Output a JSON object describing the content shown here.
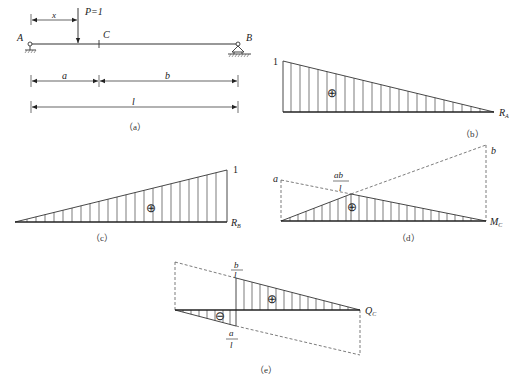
{
  "figure": {
    "panel_a": {
      "caption": "（a）",
      "support_left": "A",
      "support_right": "B",
      "section": "C",
      "load": "P=1",
      "dim_x": "x",
      "dim_a": "a",
      "dim_b": "b",
      "dim_l": "l"
    },
    "panel_b": {
      "caption": "（b）",
      "max_value": "1",
      "sign": "⊕",
      "name": "R",
      "sub": "A"
    },
    "panel_c": {
      "caption": "（c）",
      "max_value": "1",
      "sign": "⊕",
      "name": "R",
      "sub": "B"
    },
    "panel_d": {
      "caption": "（d）",
      "left_ordinate": "a",
      "right_ordinate": "b",
      "peak_num": "ab",
      "peak_den": "l",
      "sign": "⊕",
      "name": "M",
      "sub": "C"
    },
    "panel_e": {
      "caption": "（e）",
      "top_num": "b",
      "top_den": "l",
      "bottom_num": "a",
      "bottom_den": "l",
      "sign_pos": "⊕",
      "sign_neg": "⊖",
      "name": "Q",
      "sub": "C"
    }
  }
}
